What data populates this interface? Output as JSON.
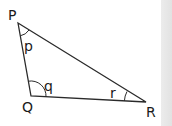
{
  "diagram": {
    "type": "triangle",
    "vertices": [
      {
        "id": "P",
        "label": "P",
        "x": 18,
        "y": 23
      },
      {
        "id": "Q",
        "label": "Q",
        "x": 31,
        "y": 96
      },
      {
        "id": "R",
        "label": "R",
        "x": 146,
        "y": 102
      }
    ],
    "angles": [
      {
        "at": "P",
        "label": "p"
      },
      {
        "at": "Q",
        "label": "q"
      },
      {
        "at": "R",
        "label": "r"
      }
    ],
    "colors": {
      "stroke": "#2a2a2a",
      "text": "#1a1a1a",
      "background": "#ffffff",
      "side_band": "#e6e6e6"
    }
  }
}
